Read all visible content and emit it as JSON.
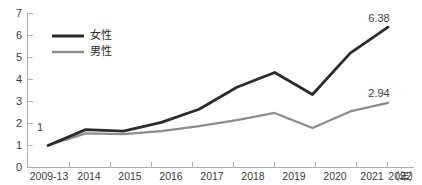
{
  "chart_data": {
    "type": "line",
    "title": "",
    "xlabel": "",
    "ylabel": "",
    "unit_note": "（年）",
    "categories": [
      "2009-13",
      "2014",
      "2015",
      "2016",
      "2017",
      "2018",
      "2019",
      "2020",
      "2021",
      "2022"
    ],
    "ylim": [
      0,
      7
    ],
    "yticks": [
      "0",
      "1",
      "2",
      "3",
      "4",
      "5",
      "6",
      "7"
    ],
    "grid": false,
    "legend_position": "top-left",
    "series": [
      {
        "name": "女性",
        "color": "#2b2b2b",
        "values": [
          1,
          1.72,
          1.65,
          2.05,
          2.65,
          3.65,
          4.32,
          3.32,
          5.2,
          6.38
        ],
        "end_label": "6.38"
      },
      {
        "name": "男性",
        "color": "#8c8c8c",
        "values": [
          1,
          1.55,
          1.52,
          1.65,
          1.88,
          2.15,
          2.48,
          1.8,
          2.55,
          2.94
        ],
        "end_label": "2.94"
      }
    ],
    "annotations": [
      {
        "text": "1",
        "note": "baseline index value at 2009-13"
      },
      {
        "text": "6.38",
        "note": "female 2022 value"
      },
      {
        "text": "2.94",
        "note": "male 2022 value"
      }
    ]
  },
  "legend": {
    "items": [
      {
        "label": "女性"
      },
      {
        "label": "男性"
      }
    ]
  },
  "axis": {
    "y_labels": [
      "7",
      "6",
      "5",
      "4",
      "3",
      "2",
      "1",
      "0"
    ],
    "x_labels": [
      "2009-13",
      "2014",
      "2015",
      "2016",
      "2017",
      "2018",
      "2019",
      "2020",
      "2021",
      "2022"
    ],
    "unit": "（年）"
  },
  "labels": {
    "start_value": "1",
    "female_end": "6.38",
    "male_end": "2.94"
  }
}
